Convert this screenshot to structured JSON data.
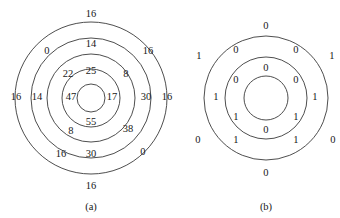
{
  "figure": {
    "panels": [
      {
        "id": "panel-a",
        "caption": "(a)",
        "caption_x": 91,
        "caption_y": 207,
        "center_x": 91,
        "center_y": 98,
        "circles": [
          {
            "name": "ring-outer",
            "r": 76
          },
          {
            "name": "ring-second",
            "r": 60
          },
          {
            "name": "ring-third",
            "r": 44
          },
          {
            "name": "ring-fourth",
            "r": 29
          },
          {
            "name": "ring-core",
            "r": 14
          }
        ],
        "labels": [
          {
            "name": "label-a-top-outer",
            "text": "16",
            "x": 91,
            "y": 14
          },
          {
            "name": "label-a-upperleft-outer",
            "text": "0",
            "x": 47,
            "y": 51
          },
          {
            "name": "label-a-upperright-outer",
            "text": "16",
            "x": 148,
            "y": 51
          },
          {
            "name": "label-a-left-outer",
            "text": "16",
            "x": 16,
            "y": 97
          },
          {
            "name": "label-a-right-outer",
            "text": "16",
            "x": 167,
            "y": 97
          },
          {
            "name": "label-a-lowerleft-outer",
            "text": "16",
            "x": 61,
            "y": 154
          },
          {
            "name": "label-a-lowerright-outer",
            "text": "0",
            "x": 143,
            "y": 152
          },
          {
            "name": "label-a-bottom-outer",
            "text": "16",
            "x": 91,
            "y": 186
          },
          {
            "name": "label-a-top-second",
            "text": "14",
            "x": 91,
            "y": 44
          },
          {
            "name": "label-a-left-second",
            "text": "14",
            "x": 37,
            "y": 97
          },
          {
            "name": "label-a-right-second",
            "text": "30",
            "x": 146,
            "y": 97
          },
          {
            "name": "label-a-bottom-second",
            "text": "30",
            "x": 91,
            "y": 154
          },
          {
            "name": "label-a-upperleft-third",
            "text": "22",
            "x": 68,
            "y": 74
          },
          {
            "name": "label-a-upperright-third",
            "text": "8",
            "x": 126,
            "y": 74
          },
          {
            "name": "label-a-lowerleft-third",
            "text": "8",
            "x": 71,
            "y": 131
          },
          {
            "name": "label-a-lowerright-third",
            "text": "38",
            "x": 128,
            "y": 129
          },
          {
            "name": "label-a-top-fourth",
            "text": "25",
            "x": 91,
            "y": 71
          },
          {
            "name": "label-a-left-fourth",
            "text": "47",
            "x": 71,
            "y": 97
          },
          {
            "name": "label-a-right-fourth",
            "text": "17",
            "x": 112,
            "y": 97
          },
          {
            "name": "label-a-bottom-fourth",
            "text": "55",
            "x": 91,
            "y": 122
          }
        ]
      },
      {
        "id": "panel-b",
        "caption": "(b)",
        "caption_x": 266,
        "caption_y": 207,
        "center_x": 266,
        "center_y": 98,
        "circles": [
          {
            "name": "ring-outer",
            "r": 62
          },
          {
            "name": "ring-middle",
            "r": 41
          },
          {
            "name": "ring-core",
            "r": 22
          }
        ],
        "labels": [
          {
            "name": "label-b-top-outer",
            "text": "0",
            "x": 266,
            "y": 26
          },
          {
            "name": "label-b-upperleft-outer",
            "text": "1",
            "x": 199,
            "y": 56
          },
          {
            "name": "label-b-upperright-outer",
            "text": "1",
            "x": 332,
            "y": 56
          },
          {
            "name": "label-b-left-outer",
            "text": "1",
            "x": 216,
            "y": 97
          },
          {
            "name": "label-b-right-outer",
            "text": "1",
            "x": 315,
            "y": 97
          },
          {
            "name": "label-b-lowerleft-outer",
            "text": "0",
            "x": 198,
            "y": 140
          },
          {
            "name": "label-b-lowerright-outer",
            "text": "0",
            "x": 333,
            "y": 140
          },
          {
            "name": "label-b-bottom-outer",
            "text": "0",
            "x": 266,
            "y": 173
          },
          {
            "name": "label-b-upperleft-middle",
            "text": "0",
            "x": 236,
            "y": 50
          },
          {
            "name": "label-b-upperright-middle",
            "text": "0",
            "x": 296,
            "y": 50
          },
          {
            "name": "label-b-lowerleft-middle",
            "text": "1",
            "x": 236,
            "y": 140
          },
          {
            "name": "label-b-lowerright-middle",
            "text": "1",
            "x": 296,
            "y": 140
          },
          {
            "name": "label-b-top-core",
            "text": "0",
            "x": 266,
            "y": 68
          },
          {
            "name": "label-b-upperleft-core",
            "text": "0",
            "x": 236,
            "y": 80
          },
          {
            "name": "label-b-upperright-core",
            "text": "0",
            "x": 296,
            "y": 80
          },
          {
            "name": "label-b-lowerleft-core",
            "text": "1",
            "x": 236,
            "y": 117
          },
          {
            "name": "label-b-lowerright-core",
            "text": "1",
            "x": 296,
            "y": 117
          },
          {
            "name": "label-b-bottom-core",
            "text": "0",
            "x": 266,
            "y": 130
          }
        ]
      }
    ]
  },
  "chart_data": {
    "type": "diagram",
    "title": "",
    "panels": [
      {
        "label": "(a)",
        "ring_count": 5,
        "values_by_ring": {
          "outer": [
            "16",
            "0",
            "16",
            "16",
            "16",
            "16",
            "0",
            "16"
          ],
          "second": [
            "14",
            "14",
            "30",
            "30"
          ],
          "third": [
            "22",
            "8",
            "8",
            "38"
          ],
          "fourth": [
            "25",
            "47",
            "17",
            "55"
          ],
          "core": []
        }
      },
      {
        "label": "(b)",
        "ring_count": 3,
        "values_by_ring": {
          "outer": [
            "0",
            "1",
            "1",
            "1",
            "1",
            "0",
            "0",
            "0"
          ],
          "middle": [
            "0",
            "0",
            "1",
            "1"
          ],
          "core": [
            "0",
            "0",
            "0",
            "1",
            "1",
            "0"
          ]
        }
      }
    ]
  }
}
